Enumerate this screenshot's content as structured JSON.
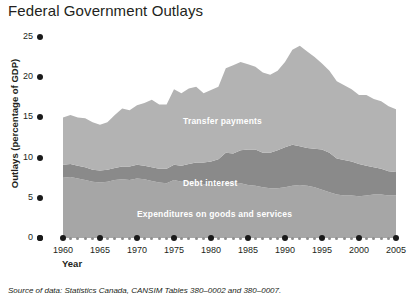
{
  "title": "Federal Government Outlays",
  "axes": {
    "ylabel": "Outlays (percentage of GDP)",
    "xlabel": "Year",
    "yticks": [
      "0",
      "5",
      "10",
      "15",
      "20",
      "25"
    ],
    "xticks": [
      "1960",
      "1965",
      "1970",
      "1975",
      "1980",
      "1985",
      "1990",
      "1995",
      "2000",
      "2005"
    ]
  },
  "series_labels": {
    "transfer": "Transfer payments",
    "debt": "Debt interest",
    "expenditures": "Expenditures on goods and services"
  },
  "source": "Source of data: Statistics Canada, CANSIM Tables 380–0002 and 380–0007.",
  "colors": {
    "transfer": "#b3b3b3",
    "debt": "#8a8a8a",
    "expenditures": "#a6a6a6",
    "axis": "#1a1a1a",
    "label_text": "#ffffff",
    "background": "#ffffff"
  },
  "chart_data": {
    "type": "area",
    "stacked": true,
    "title": "Federal Government Outlays",
    "xlabel": "Year",
    "ylabel": "Outlays (percentage of GDP)",
    "xlim": [
      1960,
      2005
    ],
    "ylim": [
      0,
      25
    ],
    "ytick_step": 5,
    "xtick_step": 5,
    "grid": false,
    "legend": "inline-labels",
    "x": [
      1960,
      1961,
      1962,
      1963,
      1964,
      1965,
      1966,
      1967,
      1968,
      1969,
      1970,
      1971,
      1972,
      1973,
      1974,
      1975,
      1976,
      1977,
      1978,
      1979,
      1980,
      1981,
      1982,
      1983,
      1984,
      1985,
      1986,
      1987,
      1988,
      1989,
      1990,
      1991,
      1992,
      1993,
      1994,
      1995,
      1996,
      1997,
      1998,
      1999,
      2000,
      2001,
      2002,
      2003,
      2004,
      2005
    ],
    "series": [
      {
        "name": "Expenditures on goods and services",
        "values": [
          7.5,
          7.6,
          7.4,
          7.2,
          7.0,
          6.9,
          7.0,
          7.2,
          7.3,
          7.2,
          7.4,
          7.3,
          7.1,
          6.9,
          6.8,
          7.2,
          7.0,
          7.1,
          7.0,
          6.7,
          6.6,
          6.5,
          6.9,
          6.9,
          6.8,
          6.6,
          6.5,
          6.3,
          6.2,
          6.2,
          6.3,
          6.5,
          6.6,
          6.5,
          6.3,
          6.0,
          5.7,
          5.4,
          5.3,
          5.3,
          5.2,
          5.3,
          5.4,
          5.4,
          5.3,
          5.3
        ]
      },
      {
        "name": "Debt interest",
        "values": [
          1.6,
          1.6,
          1.6,
          1.6,
          1.5,
          1.5,
          1.5,
          1.5,
          1.6,
          1.7,
          1.7,
          1.7,
          1.7,
          1.7,
          1.8,
          1.9,
          2.0,
          2.1,
          2.4,
          2.7,
          2.9,
          3.3,
          3.7,
          3.6,
          4.1,
          4.4,
          4.5,
          4.3,
          4.4,
          4.7,
          5.0,
          5.1,
          4.8,
          4.7,
          4.8,
          5.0,
          4.9,
          4.5,
          4.4,
          4.2,
          4.0,
          3.7,
          3.4,
          3.2,
          3.0,
          2.9
        ]
      },
      {
        "name": "Transfer payments",
        "values": [
          5.9,
          6.1,
          6.0,
          6.1,
          5.9,
          5.7,
          5.9,
          6.6,
          7.2,
          7.0,
          7.4,
          7.8,
          8.4,
          8.0,
          8.0,
          9.4,
          9.0,
          9.4,
          9.4,
          8.6,
          8.9,
          9.0,
          10.5,
          11.0,
          11.0,
          10.6,
          10.3,
          10.0,
          9.7,
          9.9,
          10.6,
          11.8,
          12.5,
          12.0,
          11.4,
          10.7,
          10.2,
          9.6,
          9.3,
          9.0,
          8.6,
          8.8,
          8.5,
          8.4,
          8.1,
          7.8
        ]
      }
    ],
    "total": [
      15.0,
      15.3,
      15.0,
      14.9,
      14.4,
      14.1,
      14.4,
      15.3,
      16.1,
      15.9,
      16.5,
      16.8,
      17.2,
      16.6,
      16.6,
      18.5,
      18.0,
      18.6,
      18.8,
      18.0,
      18.4,
      18.8,
      21.1,
      21.5,
      21.9,
      21.6,
      21.3,
      20.6,
      20.3,
      20.8,
      21.9,
      23.4,
      23.9,
      23.2,
      22.5,
      21.7,
      20.8,
      19.5,
      19.0,
      18.5,
      17.8,
      17.8,
      17.3,
      17.0,
      16.4,
      16.0
    ]
  }
}
